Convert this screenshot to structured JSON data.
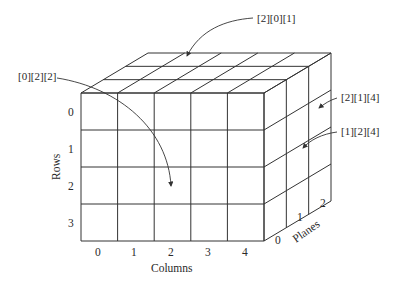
{
  "diagram": {
    "type": "3d-array-cube",
    "dimensions": {
      "rows": 4,
      "columns": 5,
      "planes": 3
    },
    "axes": {
      "rows": {
        "label": "Rows",
        "ticks": [
          "0",
          "1",
          "2",
          "3"
        ]
      },
      "columns": {
        "label": "Columns",
        "ticks": [
          "0",
          "1",
          "2",
          "3",
          "4"
        ]
      },
      "planes": {
        "label": "Planes",
        "ticks": [
          "0",
          "1",
          "2"
        ]
      }
    },
    "annotations": [
      {
        "id": "a1",
        "text": "[2][0][1]"
      },
      {
        "id": "a2",
        "text": "[0][2][2]"
      },
      {
        "id": "a3",
        "text": "[2][1][4]"
      },
      {
        "id": "a4",
        "text": "[1][2][4]"
      }
    ]
  }
}
